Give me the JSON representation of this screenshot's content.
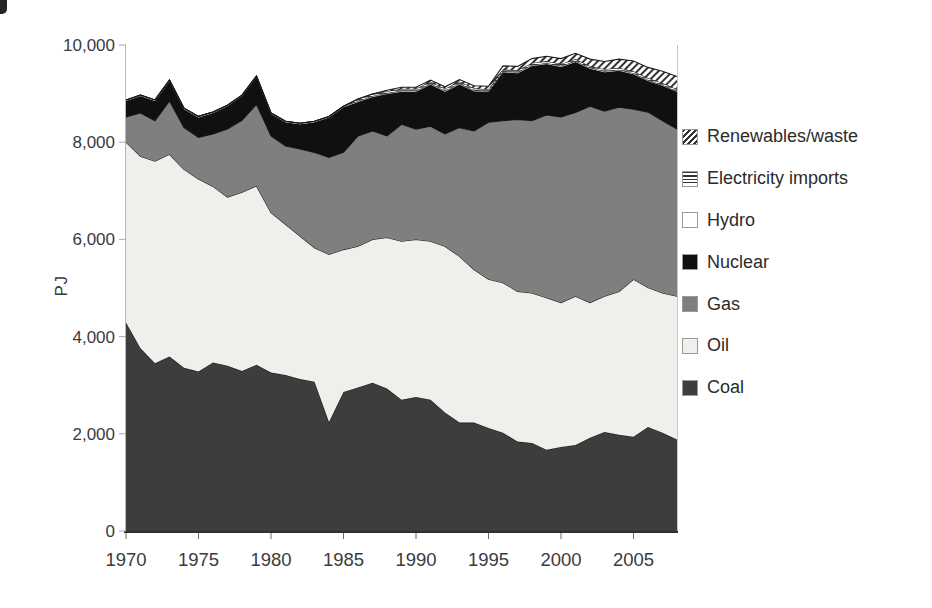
{
  "page": {
    "background": "#ffffff"
  },
  "chart_data": {
    "type": "area",
    "stacked": true,
    "title": "",
    "xlabel": "",
    "ylabel": "PJ",
    "ylim": [
      0,
      10000
    ],
    "yticks": [
      0,
      2000,
      4000,
      6000,
      8000,
      10000
    ],
    "ytick_labels": [
      "0",
      "2,000",
      "4,000",
      "6,000",
      "8,000",
      "10,000"
    ],
    "xticks": [
      1970,
      1975,
      1980,
      1985,
      1990,
      1995,
      2000,
      2005
    ],
    "grid": false,
    "legend_position": "right",
    "x": [
      1970,
      1971,
      1972,
      1973,
      1974,
      1975,
      1976,
      1977,
      1978,
      1979,
      1980,
      1981,
      1982,
      1983,
      1984,
      1985,
      1986,
      1987,
      1988,
      1989,
      1990,
      1991,
      1992,
      1993,
      1994,
      1995,
      1996,
      1997,
      1998,
      1999,
      2000,
      2001,
      2002,
      2003,
      2004,
      2005,
      2006,
      2007,
      2008
    ],
    "series": [
      {
        "name": "Coal",
        "color": "#3d3d3d",
        "values": [
          4290,
          3760,
          3450,
          3590,
          3360,
          3280,
          3470,
          3400,
          3290,
          3420,
          3260,
          3210,
          3130,
          3070,
          2240,
          2860,
          2950,
          3050,
          2930,
          2700,
          2760,
          2700,
          2440,
          2230,
          2230,
          2120,
          2020,
          1840,
          1810,
          1670,
          1730,
          1770,
          1920,
          2040,
          1980,
          1940,
          2140,
          2020,
          1880
        ]
      },
      {
        "name": "Oil",
        "color": "#f0efec",
        "values": [
          3710,
          3950,
          4160,
          4160,
          4080,
          3960,
          3620,
          3470,
          3680,
          3680,
          3290,
          3100,
          2940,
          2760,
          3450,
          2930,
          2910,
          2950,
          3110,
          3260,
          3240,
          3260,
          3420,
          3420,
          3150,
          3060,
          3090,
          3090,
          3090,
          3130,
          2970,
          3060,
          2780,
          2790,
          2950,
          3240,
          2870,
          2880,
          2950
        ]
      },
      {
        "name": "Gas",
        "color": "#7f7f7f",
        "values": [
          520,
          890,
          830,
          1100,
          860,
          860,
          1080,
          1400,
          1480,
          1680,
          1580,
          1610,
          1790,
          1960,
          2000,
          2000,
          2270,
          2230,
          2090,
          2410,
          2270,
          2370,
          2310,
          2650,
          2850,
          3230,
          3330,
          3540,
          3540,
          3760,
          3820,
          3780,
          4040,
          3810,
          3790,
          3500,
          3610,
          3540,
          3440
        ]
      },
      {
        "name": "Nuclear",
        "color": "#101010",
        "values": [
          330,
          350,
          410,
          410,
          380,
          410,
          430,
          470,
          500,
          560,
          450,
          490,
          510,
          620,
          820,
          930,
          700,
          700,
          860,
          670,
          770,
          860,
          870,
          890,
          820,
          620,
          1000,
          950,
          1130,
          1050,
          1030,
          1040,
          770,
          800,
          750,
          720,
          640,
          720,
          760
        ]
      },
      {
        "name": "Hydro",
        "color": "#ffffff",
        "values": [
          20,
          20,
          20,
          20,
          20,
          20,
          20,
          20,
          20,
          20,
          20,
          20,
          20,
          20,
          20,
          20,
          20,
          20,
          20,
          20,
          20,
          20,
          20,
          20,
          20,
          20,
          20,
          20,
          20,
          20,
          20,
          20,
          20,
          20,
          20,
          20,
          20,
          20,
          20
        ]
      },
      {
        "name": "Electricity imports",
        "pattern": "horizontal-hatch",
        "color": "#ffffff",
        "values": [
          0,
          0,
          0,
          0,
          0,
          0,
          0,
          0,
          0,
          0,
          0,
          0,
          0,
          0,
          0,
          0,
          40,
          40,
          40,
          40,
          40,
          40,
          40,
          40,
          40,
          40,
          40,
          40,
          40,
          40,
          40,
          40,
          40,
          40,
          40,
          40,
          40,
          40,
          40
        ]
      },
      {
        "name": "Renewables/waste",
        "pattern": "diagonal-hatch",
        "color": "#ffffff",
        "values": [
          0,
          0,
          0,
          0,
          0,
          0,
          0,
          0,
          0,
          0,
          0,
          0,
          0,
          0,
          0,
          0,
          0,
          0,
          20,
          30,
          30,
          30,
          40,
          40,
          50,
          60,
          70,
          80,
          90,
          100,
          110,
          120,
          140,
          160,
          180,
          210,
          220,
          240,
          260
        ]
      }
    ],
    "hatch_color": "#333333",
    "edge_color": "#1c1c1c",
    "axis_line_color": "#b8b8b8",
    "baseline_color": "#2e2e2e",
    "legend": [
      {
        "label": "Renewables/waste",
        "swatch": "diagonal-hatch"
      },
      {
        "label": "Electricity imports",
        "swatch": "horizontal-hatch"
      },
      {
        "label": "Hydro",
        "swatch": "#ffffff"
      },
      {
        "label": "Nuclear",
        "swatch": "#101010"
      },
      {
        "label": "Gas",
        "swatch": "#7f7f7f"
      },
      {
        "label": "Oil",
        "swatch": "#f0efec"
      },
      {
        "label": "Coal",
        "swatch": "#3d3d3d"
      }
    ]
  }
}
